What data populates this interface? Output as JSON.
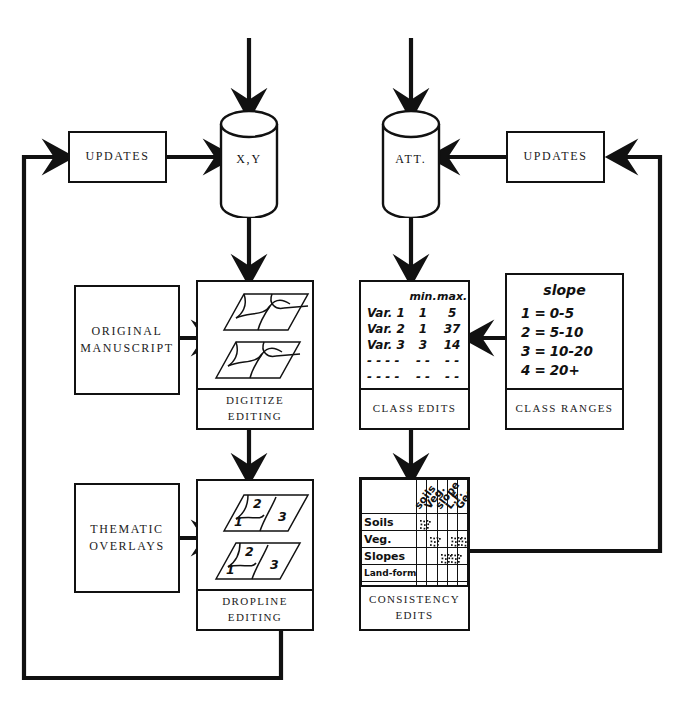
{
  "diagram": {
    "ink": "#111111"
  },
  "stores": [
    {
      "id": "xy",
      "name": "X,Y"
    },
    {
      "id": "att",
      "name": "ATT."
    }
  ],
  "updates": [
    {
      "id": "updates-left",
      "label": "UPDATES"
    },
    {
      "id": "updates-right",
      "label": "UPDATES"
    }
  ],
  "sources": [
    {
      "id": "original-manuscript",
      "line1": "ORIGINAL",
      "line2": "MANUSCRIPT"
    },
    {
      "id": "thematic-overlays",
      "line1": "THEMATIC",
      "line2": "OVERLAYS"
    }
  ],
  "process_boxes": [
    {
      "id": "digitize-editing",
      "caption_line1": "DIGITIZE",
      "caption_line2": "EDITING"
    },
    {
      "id": "dropline-editing",
      "caption_line1": "DROPLINE",
      "caption_line2": "EDITING"
    }
  ],
  "class_edits": {
    "caption": "CLASS EDITS",
    "columns": [
      "",
      "min.",
      "max."
    ],
    "rows": [
      {
        "var": "Var. 1",
        "min": "1",
        "max": "5"
      },
      {
        "var": "Var. 2",
        "min": "1",
        "max": "37"
      },
      {
        "var": "Var. 3",
        "min": "3",
        "max": "14"
      },
      {
        "var": "- - - -",
        "min": "- -",
        "max": "- -"
      },
      {
        "var": "- - - -",
        "min": "- -",
        "max": "- -"
      }
    ]
  },
  "class_ranges": {
    "caption": "CLASS RANGES",
    "heading": "slope",
    "rows": [
      {
        "code": "1",
        "eq": "=",
        "range": "0-5"
      },
      {
        "code": "2",
        "eq": "=",
        "range": "5-10"
      },
      {
        "code": "3",
        "eq": "=",
        "range": "10-20"
      },
      {
        "code": "4",
        "eq": "=",
        "range": "20+"
      }
    ]
  },
  "consistency_edits": {
    "caption": "CONSISTENCY  EDITS",
    "col_headers": [
      "soils",
      "Veg.",
      "slope",
      "L.F.",
      "Geo"
    ],
    "row_headers": [
      "Soils",
      "Veg.",
      "Slopes",
      "Land-form",
      "Geo."
    ],
    "marked_cells": [
      {
        "row": 0,
        "col": 0
      },
      {
        "row": 1,
        "col": 1
      },
      {
        "row": 1,
        "col": 3
      },
      {
        "row": 1,
        "col": 4
      },
      {
        "row": 2,
        "col": 2
      },
      {
        "row": 2,
        "col": 3
      }
    ]
  },
  "map_layers": {
    "dropline_polygon_labels": [
      "1",
      "2",
      "3"
    ]
  }
}
